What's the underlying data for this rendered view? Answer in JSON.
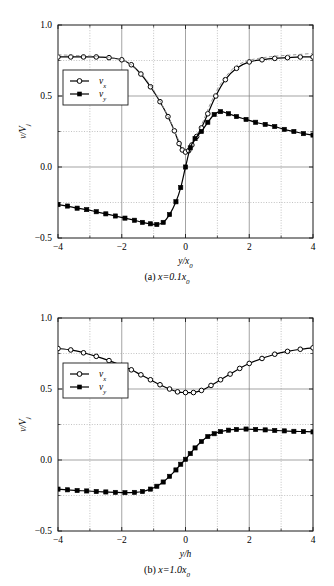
{
  "figure": {
    "background": "#ffffff",
    "axis_color": "#1a1a1a",
    "grid_color": "#9a9a9a",
    "series_color": "#000000",
    "dashed_color": "#8c8c8c"
  },
  "panels": [
    {
      "id": "panel-a",
      "caption_prefix": "(a)",
      "caption_body": "x=0.1x",
      "caption_sub": "0",
      "caption_full": "(a)  x=0.1x0"
    },
    {
      "id": "panel-b",
      "caption_prefix": "(b)",
      "caption_body": "x=1.0x",
      "caption_sub": "0",
      "caption_full": "(b)  x=1.0x0"
    }
  ],
  "legend": {
    "items": [
      {
        "label_main": "v",
        "label_sub": "x",
        "marker": "open-circle"
      },
      {
        "label_main": "v",
        "label_sub": "y",
        "marker": "filled-square"
      }
    ]
  },
  "chart_data": [
    {
      "type": "line",
      "title": "(a) x=0.1x0",
      "xlabel": "y/x0",
      "ylabel": "v/Vj",
      "xlim": [
        -4,
        4
      ],
      "ylim": [
        -0.5,
        1.0
      ],
      "xticks": [
        -4,
        -2,
        0,
        2,
        4
      ],
      "xticklabels": [
        "-4",
        "-2",
        "0",
        "2",
        "4"
      ],
      "xminorticks": [
        -3,
        -1,
        1,
        3
      ],
      "yticks": [
        1.0,
        0.5,
        0.0,
        -0.5
      ],
      "yticklabels": [
        "1.0",
        "0.5",
        "0.0",
        "-0.5"
      ],
      "ygridlines": [
        0.75,
        0.25,
        -0.25
      ],
      "xgridlines": [
        -2,
        0,
        2
      ],
      "grid": true,
      "legend_position": "upper-left-inside",
      "series": [
        {
          "name": "vx",
          "marker": "open-circle",
          "linestyle": "solid",
          "x": [
            -4.0,
            -3.6,
            -3.2,
            -2.8,
            -2.4,
            -2.0,
            -1.7,
            -1.4,
            -1.1,
            -0.8,
            -0.55,
            -0.35,
            -0.2,
            -0.1,
            0.0,
            0.1,
            0.2,
            0.35,
            0.5,
            0.7,
            0.95,
            1.25,
            1.6,
            2.0,
            2.4,
            2.8,
            3.2,
            3.6,
            4.0
          ],
          "y": [
            0.775,
            0.775,
            0.775,
            0.775,
            0.77,
            0.755,
            0.72,
            0.655,
            0.565,
            0.46,
            0.355,
            0.255,
            0.165,
            0.12,
            0.105,
            0.115,
            0.155,
            0.215,
            0.275,
            0.375,
            0.5,
            0.615,
            0.695,
            0.74,
            0.755,
            0.765,
            0.77,
            0.775,
            0.775
          ]
        },
        {
          "name": "vx-reference-dashed",
          "marker": "none",
          "linestyle": "dashed",
          "x": [
            -4.0,
            -3.4,
            -2.8,
            -2.3,
            -1.9,
            -1.5,
            -1.1,
            -0.8,
            -0.5,
            -0.25,
            0.0,
            0.25,
            0.5,
            0.8,
            1.1,
            1.5,
            1.9,
            2.3,
            2.8,
            3.4,
            4.0
          ],
          "y": [
            0.79,
            0.785,
            0.78,
            0.77,
            0.745,
            0.685,
            0.575,
            0.465,
            0.335,
            0.205,
            0.115,
            0.185,
            0.295,
            0.455,
            0.585,
            0.695,
            0.745,
            0.765,
            0.78,
            0.79,
            0.8
          ]
        },
        {
          "name": "vy",
          "marker": "filled-square",
          "linestyle": "solid",
          "x": [
            -4.0,
            -3.7,
            -3.4,
            -3.1,
            -2.8,
            -2.5,
            -2.2,
            -1.9,
            -1.6,
            -1.35,
            -1.1,
            -0.9,
            -0.7,
            -0.5,
            -0.3,
            -0.15,
            0.0,
            0.15,
            0.3,
            0.5,
            0.7,
            0.9,
            1.1,
            1.35,
            1.6,
            1.9,
            2.2,
            2.5,
            2.8,
            3.1,
            3.4,
            3.7,
            4.0
          ],
          "y": [
            -0.265,
            -0.275,
            -0.29,
            -0.3,
            -0.315,
            -0.33,
            -0.345,
            -0.36,
            -0.375,
            -0.39,
            -0.4,
            -0.405,
            -0.39,
            -0.335,
            -0.245,
            -0.145,
            0.0,
            0.135,
            0.2,
            0.25,
            0.315,
            0.37,
            0.39,
            0.375,
            0.355,
            0.335,
            0.315,
            0.3,
            0.285,
            0.265,
            0.25,
            0.235,
            0.225
          ]
        }
      ]
    },
    {
      "type": "line",
      "title": "(b) x=1.0x0",
      "xlabel": "y/h",
      "ylabel": "v/Vj",
      "xlim": [
        -4,
        4
      ],
      "ylim": [
        -0.5,
        1.0
      ],
      "xticks": [
        -4,
        -2,
        0,
        2,
        4
      ],
      "xticklabels": [
        "-4",
        "-2",
        "0",
        "2",
        "4"
      ],
      "xminorticks": [
        -3,
        -1,
        1,
        3
      ],
      "yticks": [
        1.0,
        0.5,
        0.0,
        -0.5
      ],
      "yticklabels": [
        "1.0",
        "0.5",
        "0.0",
        "-0.5"
      ],
      "ygridlines": [
        0.75,
        0.25,
        -0.25
      ],
      "xgridlines": [
        -2,
        0,
        2
      ],
      "grid": true,
      "legend_position": "upper-left-inside",
      "series": [
        {
          "name": "vx",
          "marker": "open-circle",
          "linestyle": "solid",
          "x": [
            -4.0,
            -3.6,
            -3.2,
            -2.8,
            -2.4,
            -2.0,
            -1.7,
            -1.4,
            -1.1,
            -0.8,
            -0.5,
            -0.25,
            0.0,
            0.25,
            0.5,
            0.8,
            1.1,
            1.4,
            1.7,
            2.0,
            2.4,
            2.8,
            3.2,
            3.6,
            4.0
          ],
          "y": [
            0.785,
            0.775,
            0.755,
            0.73,
            0.7,
            0.665,
            0.635,
            0.6,
            0.565,
            0.53,
            0.5,
            0.48,
            0.475,
            0.475,
            0.49,
            0.525,
            0.565,
            0.605,
            0.645,
            0.68,
            0.715,
            0.745,
            0.765,
            0.78,
            0.79
          ]
        },
        {
          "name": "vy",
          "marker": "filled-square",
          "linestyle": "solid",
          "x": [
            -4.0,
            -3.7,
            -3.4,
            -3.1,
            -2.8,
            -2.5,
            -2.2,
            -1.9,
            -1.6,
            -1.35,
            -1.1,
            -0.9,
            -0.7,
            -0.5,
            -0.3,
            -0.15,
            0.0,
            0.15,
            0.3,
            0.5,
            0.7,
            0.9,
            1.1,
            1.35,
            1.6,
            1.9,
            2.2,
            2.5,
            2.8,
            3.1,
            3.4,
            3.7,
            4.0
          ],
          "y": [
            -0.205,
            -0.21,
            -0.215,
            -0.218,
            -0.222,
            -0.225,
            -0.228,
            -0.23,
            -0.228,
            -0.222,
            -0.205,
            -0.185,
            -0.155,
            -0.115,
            -0.07,
            -0.03,
            0.005,
            0.045,
            0.085,
            0.13,
            0.165,
            0.185,
            0.2,
            0.21,
            0.215,
            0.218,
            0.215,
            0.212,
            0.208,
            0.205,
            0.202,
            0.2,
            0.198
          ]
        }
      ]
    }
  ]
}
